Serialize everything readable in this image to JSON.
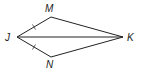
{
  "diagram": {
    "type": "geometry-kite",
    "vertices": [
      {
        "id": "J",
        "label": "J",
        "x": 17,
        "y": 37,
        "lx": 5,
        "ly": 41
      },
      {
        "id": "M",
        "label": "M",
        "x": 51,
        "y": 17,
        "lx": 45,
        "ly": 12
      },
      {
        "id": "K",
        "label": "K",
        "x": 123,
        "y": 37,
        "lx": 127,
        "ly": 41
      },
      {
        "id": "N",
        "label": "N",
        "x": 51,
        "y": 57,
        "lx": 46,
        "ly": 68
      }
    ],
    "segments": [
      {
        "from": "J",
        "to": "M",
        "congruent_mark": true
      },
      {
        "from": "M",
        "to": "K",
        "congruent_mark": false
      },
      {
        "from": "K",
        "to": "N",
        "congruent_mark": false
      },
      {
        "from": "N",
        "to": "J",
        "congruent_mark": true
      },
      {
        "from": "J",
        "to": "K",
        "congruent_mark": false
      }
    ],
    "colors": {
      "stroke": "#222222",
      "label": "#1a1a1a"
    }
  }
}
